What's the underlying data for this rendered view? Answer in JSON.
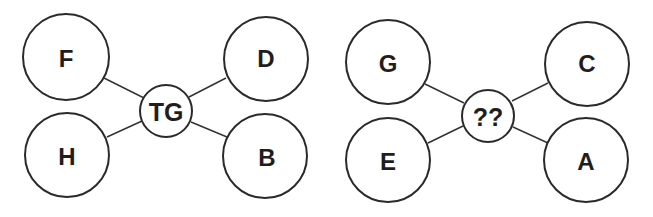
{
  "puzzle": {
    "diagrams": [
      {
        "center": "TG",
        "nodes": {
          "top_left": "F",
          "top_right": "D",
          "bottom_left": "H",
          "bottom_right": "B"
        }
      },
      {
        "center": "??",
        "nodes": {
          "top_left": "G",
          "top_right": "C",
          "bottom_left": "E",
          "bottom_right": "A"
        }
      }
    ]
  }
}
